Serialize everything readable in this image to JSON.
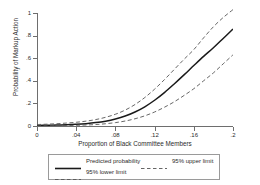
{
  "chart_data": {
    "type": "line",
    "title": "",
    "xlabel": "Proportion of Black Committee Members",
    "ylabel": "Probability of Markup Action",
    "xlim": [
      0,
      0.2
    ],
    "ylim": [
      0,
      1.05
    ],
    "grid": false,
    "legend_position": "bottom",
    "xticks": [
      0,
      0.04,
      0.08,
      0.12,
      0.16,
      0.2
    ],
    "xticklabels": [
      "0",
      ".04",
      ".08",
      ".12",
      ".16",
      ".2"
    ],
    "yticks": [
      0,
      0.2,
      0.4,
      0.6,
      0.8,
      1
    ],
    "yticklabels": [
      "0",
      ".2",
      ".4",
      ".6",
      ".8",
      "1"
    ],
    "x": [
      0,
      0.01,
      0.02,
      0.03,
      0.04,
      0.05,
      0.06,
      0.07,
      0.08,
      0.09,
      0.1,
      0.11,
      0.12,
      0.13,
      0.14,
      0.15,
      0.16,
      0.17,
      0.18,
      0.19,
      0.2
    ],
    "series": [
      {
        "name": "Predicted probability",
        "style": "solid",
        "color": "#1a1a1a",
        "values": [
          0.005,
          0.006,
          0.008,
          0.011,
          0.015,
          0.021,
          0.03,
          0.043,
          0.062,
          0.088,
          0.124,
          0.17,
          0.228,
          0.296,
          0.372,
          0.452,
          0.535,
          0.616,
          0.692,
          0.775,
          0.858
        ]
      },
      {
        "name": "95% upper limit",
        "style": "dashed",
        "color": "#555555",
        "values": [
          0.013,
          0.016,
          0.02,
          0.026,
          0.033,
          0.043,
          0.057,
          0.077,
          0.104,
          0.141,
          0.19,
          0.252,
          0.326,
          0.41,
          0.5,
          0.59,
          0.676,
          0.78,
          0.878,
          0.96,
          1.03
        ]
      },
      {
        "name": "95% lower limit",
        "style": "dashed",
        "color": "#555555",
        "values": [
          0.002,
          0.0025,
          0.003,
          0.004,
          0.006,
          0.009,
          0.013,
          0.02,
          0.03,
          0.044,
          0.064,
          0.09,
          0.124,
          0.166,
          0.214,
          0.27,
          0.33,
          0.4,
          0.47,
          0.55,
          0.63
        ]
      }
    ],
    "legend_entries": [
      {
        "label": "Predicted probability",
        "style": "solid",
        "color": "#1a1a1a"
      },
      {
        "label": "95% upper limit",
        "style": "dashed",
        "color": "#555555"
      },
      {
        "label": "95% lower limit",
        "style": "dashed",
        "color": "#555555"
      }
    ],
    "colors": {
      "axis": "#6e6e6e",
      "text": "#2b2b2b",
      "background": "#ffffff",
      "legend_border": "#9a9a9a"
    }
  }
}
